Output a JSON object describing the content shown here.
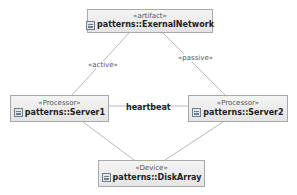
{
  "diagram": {
    "type": "UML deployment diagram",
    "colors": {
      "node_border": "#a8a8a8",
      "node_fill": "#ececec",
      "edge": "#b8b8b8",
      "text": "#222222"
    },
    "nodes": [
      {
        "id": "external",
        "stereotype": "«artifact»",
        "name": "patterns::ExernalNetwork",
        "icon": "artifact-icon"
      },
      {
        "id": "server1",
        "stereotype": "«Processor»",
        "name": "patterns::Server1",
        "icon": "processor-icon"
      },
      {
        "id": "server2",
        "stereotype": "«Processor»",
        "name": "patterns::Server2",
        "icon": "processor-icon"
      },
      {
        "id": "diskarray",
        "stereotype": "«Device»",
        "name": "patterns::DiskArray",
        "icon": "device-icon"
      }
    ],
    "edges": [
      {
        "from": "external",
        "to": "server1",
        "label": "«active»"
      },
      {
        "from": "external",
        "to": "server2",
        "label": "«passive»"
      },
      {
        "from": "server1",
        "to": "server2",
        "label": "heartbeat"
      },
      {
        "from": "server1",
        "to": "diskarray",
        "label": ""
      },
      {
        "from": "server2",
        "to": "diskarray",
        "label": ""
      }
    ]
  }
}
